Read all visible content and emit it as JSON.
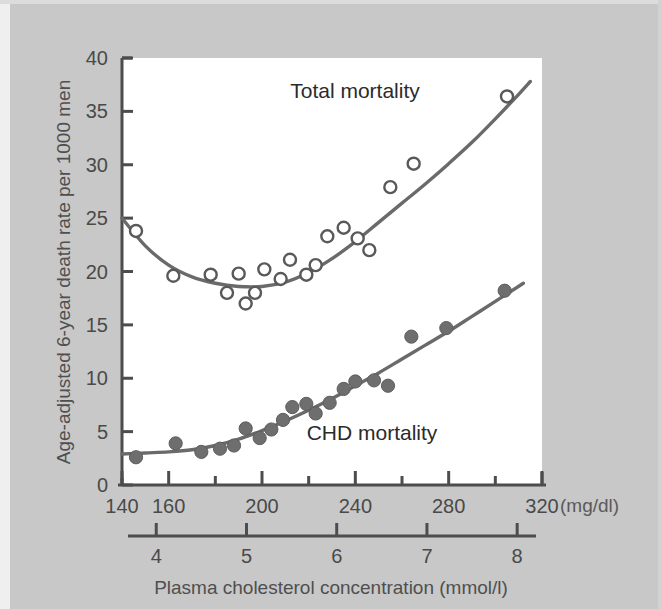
{
  "figure": {
    "background_color": "#c8c8c8",
    "plot_background_color": "#ffffff",
    "ink_color": "#555555",
    "text_color": "#474747"
  },
  "chart_data": {
    "type": "scatter",
    "title": "",
    "subtitle": "",
    "xlabel": "Plasma cholesterol concentration (mmol/l)",
    "ylabel": "Age-adjusted 6-year death rate per 1000 men",
    "grid": false,
    "legend_position": "inline-annotation",
    "ylim": [
      0,
      40
    ],
    "ytick_labels": [
      "0",
      "5",
      "10",
      "15",
      "20",
      "25",
      "30",
      "35",
      "40"
    ],
    "yticks": [
      0,
      5,
      10,
      15,
      20,
      25,
      30,
      35,
      40
    ],
    "x_axis_primary": {
      "unit_label": "(mg/dl)",
      "lim": [
        140,
        320
      ],
      "ticks": [
        140,
        160,
        180,
        200,
        220,
        240,
        260,
        280,
        300,
        320
      ],
      "tick_labels": [
        "140",
        "160",
        "",
        "200",
        "",
        "240",
        "",
        "280",
        "",
        "320"
      ]
    },
    "x_axis_secondary": {
      "unit_label": "mmol/l",
      "lim": [
        3.62,
        8.28
      ],
      "ticks": [
        4,
        5,
        6,
        7,
        8
      ],
      "tick_labels": [
        "4",
        "5",
        "6",
        "7",
        "8"
      ]
    },
    "series": [
      {
        "name": "Total mortality",
        "marker": "open-circle",
        "annotation": "Total mortality",
        "annotation_x": 242,
        "annotation_y": 36.2,
        "points": [
          {
            "x": 146,
            "y": 23.8
          },
          {
            "x": 162,
            "y": 19.6
          },
          {
            "x": 178,
            "y": 19.7
          },
          {
            "x": 185,
            "y": 18.0
          },
          {
            "x": 190,
            "y": 19.8
          },
          {
            "x": 193,
            "y": 17.0
          },
          {
            "x": 197,
            "y": 18.0
          },
          {
            "x": 201,
            "y": 20.2
          },
          {
            "x": 208,
            "y": 19.3
          },
          {
            "x": 212,
            "y": 21.1
          },
          {
            "x": 219,
            "y": 19.7
          },
          {
            "x": 223,
            "y": 20.6
          },
          {
            "x": 228,
            "y": 23.3
          },
          {
            "x": 235,
            "y": 24.1
          },
          {
            "x": 241,
            "y": 23.1
          },
          {
            "x": 246,
            "y": 22.0
          },
          {
            "x": 255,
            "y": 27.9
          },
          {
            "x": 265,
            "y": 30.1
          },
          {
            "x": 305,
            "y": 36.4
          }
        ],
        "fit_curve": [
          {
            "x": 140,
            "y": 25.0
          },
          {
            "x": 150,
            "y": 22.4
          },
          {
            "x": 160,
            "y": 20.6
          },
          {
            "x": 170,
            "y": 19.5
          },
          {
            "x": 180,
            "y": 18.9
          },
          {
            "x": 190,
            "y": 18.6
          },
          {
            "x": 200,
            "y": 18.6
          },
          {
            "x": 210,
            "y": 19.0
          },
          {
            "x": 220,
            "y": 19.9
          },
          {
            "x": 230,
            "y": 21.2
          },
          {
            "x": 240,
            "y": 22.8
          },
          {
            "x": 250,
            "y": 24.6
          },
          {
            "x": 260,
            "y": 26.4
          },
          {
            "x": 270,
            "y": 28.2
          },
          {
            "x": 280,
            "y": 30.1
          },
          {
            "x": 290,
            "y": 32.1
          },
          {
            "x": 300,
            "y": 34.3
          },
          {
            "x": 310,
            "y": 36.6
          },
          {
            "x": 315,
            "y": 37.8
          }
        ]
      },
      {
        "name": "CHD mortality",
        "marker": "filled-circle",
        "annotation": "CHD mortality",
        "annotation_x": 243,
        "annotation_y": 4.9,
        "points": [
          {
            "x": 146,
            "y": 2.6
          },
          {
            "x": 163,
            "y": 3.9
          },
          {
            "x": 174,
            "y": 3.1
          },
          {
            "x": 182,
            "y": 3.4
          },
          {
            "x": 188,
            "y": 3.7
          },
          {
            "x": 193,
            "y": 5.3
          },
          {
            "x": 199,
            "y": 4.4
          },
          {
            "x": 204,
            "y": 5.2
          },
          {
            "x": 209,
            "y": 6.1
          },
          {
            "x": 213,
            "y": 7.3
          },
          {
            "x": 219,
            "y": 7.6
          },
          {
            "x": 223,
            "y": 6.7
          },
          {
            "x": 229,
            "y": 7.7
          },
          {
            "x": 235,
            "y": 9.0
          },
          {
            "x": 240,
            "y": 9.7
          },
          {
            "x": 248,
            "y": 9.8
          },
          {
            "x": 254,
            "y": 9.3
          },
          {
            "x": 264,
            "y": 13.9
          },
          {
            "x": 279,
            "y": 14.7
          },
          {
            "x": 304,
            "y": 18.2
          }
        ],
        "fit_curve": [
          {
            "x": 140,
            "y": 2.9
          },
          {
            "x": 150,
            "y": 3.0
          },
          {
            "x": 160,
            "y": 3.1
          },
          {
            "x": 170,
            "y": 3.3
          },
          {
            "x": 180,
            "y": 3.7
          },
          {
            "x": 190,
            "y": 4.3
          },
          {
            "x": 200,
            "y": 5.1
          },
          {
            "x": 210,
            "y": 6.0
          },
          {
            "x": 220,
            "y": 7.0
          },
          {
            "x": 230,
            "y": 8.1
          },
          {
            "x": 240,
            "y": 9.3
          },
          {
            "x": 250,
            "y": 10.5
          },
          {
            "x": 260,
            "y": 11.8
          },
          {
            "x": 270,
            "y": 13.1
          },
          {
            "x": 280,
            "y": 14.4
          },
          {
            "x": 290,
            "y": 15.8
          },
          {
            "x": 300,
            "y": 17.2
          },
          {
            "x": 312,
            "y": 18.9
          }
        ]
      }
    ]
  }
}
